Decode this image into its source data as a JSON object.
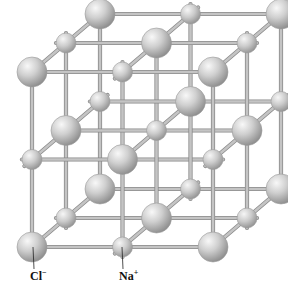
{
  "lattice": {
    "size": 3,
    "origin": [
      32,
      247
    ],
    "step_x": [
      90.5,
      0
    ],
    "step_y": [
      0,
      -87.5
    ],
    "step_z": [
      34,
      -29
    ],
    "colors": {
      "rod": "#c4c4c4",
      "rod_edge": "#8a8a8a",
      "sphere_light": "#f4f4f4",
      "sphere_mid": "#c8c8c8",
      "sphere_dark": "#8e8e8e",
      "leader_line": "#222222"
    },
    "ions": {
      "large": {
        "name": "chloride",
        "radius": 15
      },
      "small": {
        "name": "sodium",
        "radius": 10
      }
    }
  },
  "labels": {
    "cl": {
      "base": "Cl",
      "charge": "−",
      "x": 30,
      "y": 270,
      "anchor": [
        33,
        247
      ]
    },
    "na": {
      "base": "Na",
      "charge": "+",
      "x": 119,
      "y": 270,
      "anchor": [
        122,
        247
      ]
    }
  }
}
